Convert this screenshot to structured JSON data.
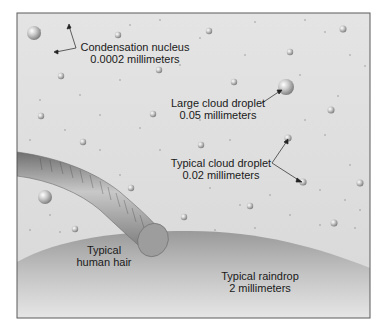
{
  "figure": {
    "frame_color": "#5a5a5a",
    "background_color": "#dedede",
    "raindrop_color": "#a8a8a8",
    "hair_color": "#8f8f8f"
  },
  "labels": {
    "condensation_nucleus": {
      "name": "Condensation nucleus",
      "size": "0.0002 millimeters"
    },
    "large_cloud_droplet": {
      "name": "Large cloud droplet",
      "size": "0.05 millimeters"
    },
    "typical_cloud_droplet": {
      "name": "Typical cloud droplet",
      "size": "0.02 millimeters"
    },
    "human_hair": {
      "name": "Typical",
      "size": "human hair"
    },
    "raindrop": {
      "name": "Typical raindrop",
      "size": "2 millimeters"
    }
  }
}
